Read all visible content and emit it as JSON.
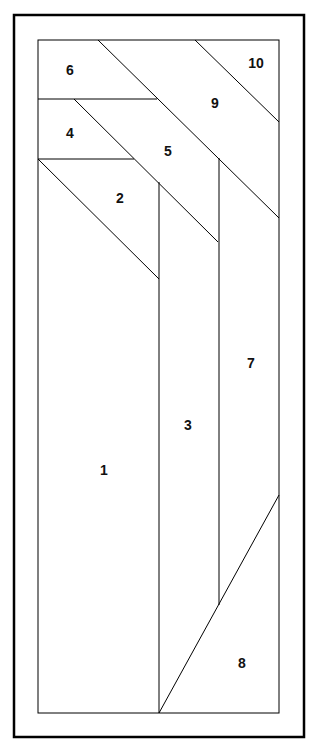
{
  "diagram": {
    "type": "paper-piecing-pattern",
    "pieces": [
      {
        "id": "1",
        "label": "1",
        "x": 104,
        "y": 470
      },
      {
        "id": "2",
        "label": "2",
        "x": 120,
        "y": 198
      },
      {
        "id": "3",
        "label": "3",
        "x": 188,
        "y": 425
      },
      {
        "id": "4",
        "label": "4",
        "x": 70,
        "y": 133
      },
      {
        "id": "5",
        "label": "5",
        "x": 168,
        "y": 151
      },
      {
        "id": "6",
        "label": "6",
        "x": 70,
        "y": 70
      },
      {
        "id": "7",
        "label": "7",
        "x": 251,
        "y": 363
      },
      {
        "id": "8",
        "label": "8",
        "x": 242,
        "y": 663
      },
      {
        "id": "9",
        "label": "9",
        "x": 215,
        "y": 103
      },
      {
        "id": "10",
        "label": "10",
        "x": 256,
        "y": 63
      }
    ]
  }
}
